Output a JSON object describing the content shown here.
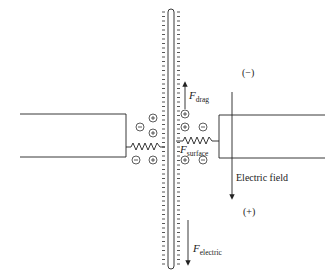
{
  "diagram": {
    "title": "",
    "labels": {
      "negative_pole": "(−)",
      "positive_pole": "(+)",
      "electric_field": "Electric field",
      "f_drag_main": "F",
      "f_drag_sub": "drag",
      "f_surface_main": "F",
      "f_surface_sub": "surface",
      "f_electric_main": "F",
      "f_electric_sub": "electric"
    },
    "ions": {
      "plus_symbol": "+",
      "minus_symbol": "−"
    },
    "colors": {
      "line": "#222222",
      "background": "#ffffff"
    }
  }
}
